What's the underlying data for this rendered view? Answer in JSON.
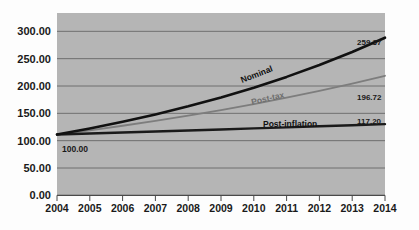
{
  "chart_data": {
    "type": "line",
    "title": "",
    "xlabel": "",
    "ylabel": "",
    "x": [
      2004,
      2005,
      2006,
      2007,
      2008,
      2009,
      2010,
      2011,
      2012,
      2013,
      2014
    ],
    "categories": [
      "2004",
      "2005",
      "2006",
      "2007",
      "2008",
      "2009",
      "2010",
      "2011",
      "2012",
      "2013",
      "2014"
    ],
    "ylim": [
      0,
      300
    ],
    "ytick_values": [
      0,
      50,
      100,
      150,
      200,
      250,
      300
    ],
    "ytick_labels": [
      "0.00",
      "50.00",
      "100.00",
      "150.00",
      "200.00",
      "250.00",
      "300.00"
    ],
    "grid": true,
    "grid_axis": "y",
    "legend": "inline-series-labels",
    "plot_background": "#b5b5b5",
    "grid_color": "#6f6f6f",
    "series": [
      {
        "name": "Nominal",
        "color": "#111111",
        "width": 2.6,
        "values": [
          100.0,
          110.0,
          121.0,
          133.1,
          146.41,
          161.05,
          177.16,
          194.87,
          214.36,
          235.79,
          259.37
        ],
        "end_label": "259.37"
      },
      {
        "name": "Post-tax",
        "color": "#7d7d7d",
        "width": 1.8,
        "values": [
          100.0,
          107.0,
          114.49,
          122.5,
          131.08,
          140.26,
          150.07,
          160.58,
          171.82,
          183.85,
          196.72
        ],
        "end_label": "196.72"
      },
      {
        "name": "Post-inflation",
        "color": "#1a1a1a",
        "width": 2.4,
        "values": [
          100.0,
          101.62,
          103.26,
          104.93,
          106.63,
          108.35,
          110.1,
          111.88,
          113.69,
          115.43,
          117.2
        ],
        "end_label": "117.20"
      }
    ],
    "annotations": [
      {
        "text": "100.00",
        "role": "start-value-label",
        "x": 2004,
        "y": 100.0
      },
      {
        "text": "259.37",
        "role": "end-value-label",
        "series": "Nominal"
      },
      {
        "text": "196.72",
        "role": "end-value-label",
        "series": "Post-tax"
      },
      {
        "text": "117.20",
        "role": "end-value-label",
        "series": "Post-inflation"
      },
      {
        "text": "Nominal",
        "role": "inline-series-label",
        "rotation": -21
      },
      {
        "text": "Post-tax",
        "role": "inline-series-label",
        "rotation": -13
      },
      {
        "text": "Post-inflation",
        "role": "inline-series-label",
        "rotation": 0
      }
    ]
  }
}
